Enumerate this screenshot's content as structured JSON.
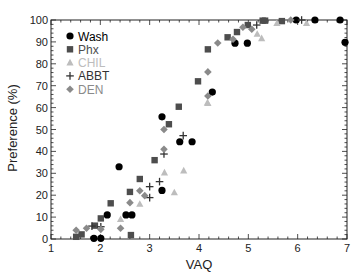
{
  "chart_data": {
    "type": "scatter",
    "title": "",
    "xlabel": "VAQ",
    "ylabel": "Preference (%)",
    "xlim": [
      1,
      7
    ],
    "ylim": [
      0,
      100
    ],
    "x_ticks": [
      1,
      2,
      3,
      4,
      5,
      6,
      7
    ],
    "y_ticks": [
      0,
      10,
      20,
      30,
      40,
      50,
      60,
      70,
      80,
      90,
      100
    ],
    "grid": false,
    "legend_position": "upper-left",
    "series": [
      {
        "name": "Wash",
        "marker": "circle",
        "color": "#000000",
        "points": [
          [
            1.87,
            0.3
          ],
          [
            2.01,
            0.3
          ],
          [
            2.14,
            11
          ],
          [
            2.38,
            33
          ],
          [
            2.52,
            11
          ],
          [
            2.64,
            11
          ],
          [
            3.25,
            22.2
          ],
          [
            3.25,
            55.8
          ],
          [
            3.61,
            44.4
          ],
          [
            3.86,
            44.4
          ],
          [
            4.27,
            67.1
          ],
          [
            4.73,
            89.4
          ],
          [
            4.98,
            89.4
          ],
          [
            5.97,
            100
          ],
          [
            6.35,
            100
          ],
          [
            6.86,
            100
          ],
          [
            6.96,
            89.8
          ]
        ]
      },
      {
        "name": "Phx",
        "marker": "square",
        "color": "#4d4d4d",
        "points": [
          [
            1.51,
            1
          ],
          [
            1.62,
            2.1
          ],
          [
            1.89,
            6.1
          ],
          [
            2.01,
            9.4
          ],
          [
            2.21,
            16.3
          ],
          [
            2.6,
            21.5
          ],
          [
            2.62,
            1.8
          ],
          [
            2.8,
            27.4
          ],
          [
            3.1,
            36
          ],
          [
            3.39,
            52.4
          ],
          [
            3.59,
            60.4
          ],
          [
            3.98,
            72
          ],
          [
            4.18,
            86.6
          ],
          [
            4.58,
            92.1
          ],
          [
            4.77,
            94.5
          ],
          [
            4.99,
            97.7
          ],
          [
            5.29,
            99.7
          ],
          [
            5.34,
            99.7
          ],
          [
            5.68,
            99.5
          ]
        ]
      },
      {
        "name": "CHIL",
        "marker": "triangle",
        "color": "#bdbdbd",
        "points": [
          [
            2.41,
            9
          ],
          [
            2.8,
            16
          ],
          [
            3.3,
            30.3
          ],
          [
            3.5,
            21.2
          ],
          [
            3.69,
            31.2
          ],
          [
            4.17,
            62.2
          ],
          [
            4.18,
            62
          ],
          [
            5.18,
            93.6
          ],
          [
            5.27,
            91.6
          ],
          [
            5.58,
            98.5
          ],
          [
            6.18,
            98.5
          ]
        ]
      },
      {
        "name": "ABBT",
        "marker": "plus",
        "color": "#333333",
        "points": [
          [
            1.83,
            5.9
          ],
          [
            2.01,
            5.6
          ],
          [
            3.0,
            18.9
          ],
          [
            3.0,
            23.9
          ],
          [
            3.2,
            26.2
          ],
          [
            3.29,
            38.8
          ],
          [
            3.68,
            47.2
          ],
          [
            5.17,
            97.7
          ],
          [
            6.08,
            100
          ]
        ]
      },
      {
        "name": "DEN",
        "marker": "diamond",
        "color": "#8a8a8a",
        "points": [
          [
            1.51,
            4
          ],
          [
            1.72,
            4.9
          ],
          [
            2.01,
            4.4
          ],
          [
            2.41,
            4.9
          ],
          [
            2.6,
            16.6
          ],
          [
            2.8,
            22
          ],
          [
            2.9,
            19.8
          ],
          [
            3.29,
            41
          ],
          [
            3.29,
            50
          ],
          [
            4.18,
            65.3
          ],
          [
            4.18,
            76.3
          ],
          [
            4.38,
            89.5
          ],
          [
            4.69,
            91.2
          ],
          [
            4.89,
            96.7
          ],
          [
            5.07,
            95.8
          ],
          [
            5.86,
            100
          ]
        ]
      }
    ]
  }
}
